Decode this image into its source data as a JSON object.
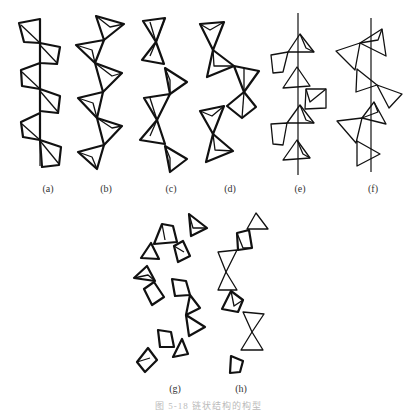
{
  "figure": {
    "caption": "图 5-18  链状结构的构型",
    "panels": [
      {
        "id": "a",
        "label": "(a)",
        "label_x": 48,
        "label_y": 185
      },
      {
        "id": "b",
        "label": "(b)",
        "label_x": 106,
        "label_y": 185
      },
      {
        "id": "c",
        "label": "(c)",
        "label_x": 171,
        "label_y": 185
      },
      {
        "id": "d",
        "label": "(d)",
        "label_x": 230,
        "label_y": 185
      },
      {
        "id": "e",
        "label": "(e)",
        "label_x": 300,
        "label_y": 185
      },
      {
        "id": "f",
        "label": "(f)",
        "label_x": 373,
        "label_y": 185
      },
      {
        "id": "g",
        "label": "(g)",
        "label_x": 175,
        "label_y": 385
      },
      {
        "id": "h",
        "label": "(h)",
        "label_x": 241,
        "label_y": 385
      }
    ],
    "stroke_color": "#111111",
    "background": "#ffffff"
  }
}
